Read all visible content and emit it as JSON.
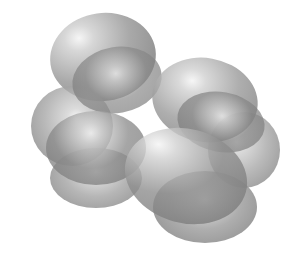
{
  "figure": {
    "background": "#ffffff",
    "base_color": "#8c8c8c",
    "highlight_color": "#f4f4f4",
    "lobes": [
      {
        "name": "lobe-top-left-back",
        "cx": 103,
        "cy": 57,
        "rx": 53,
        "ry": 44,
        "rot": -8,
        "hx": 30,
        "hy": 25,
        "alpha": 0.85,
        "shade": "#9a9a9a"
      },
      {
        "name": "lobe-left-back",
        "cx": 72,
        "cy": 126,
        "rx": 41,
        "ry": 40,
        "rot": 0,
        "hx": 55,
        "hy": 40,
        "alpha": 0.75,
        "shade": "#a3a3a3"
      },
      {
        "name": "lobe-right-back",
        "cx": 244,
        "cy": 150,
        "rx": 36,
        "ry": 38,
        "rot": 0,
        "hx": 40,
        "hy": 40,
        "alpha": 0.75,
        "shade": "#a3a3a3"
      },
      {
        "name": "lobe-bottom-left-back",
        "cx": 96,
        "cy": 178,
        "rx": 46,
        "ry": 30,
        "rot": 0,
        "hx": 50,
        "hy": 40,
        "alpha": 0.75,
        "shade": "#9e9e9e"
      },
      {
        "name": "lobe-bottom-right-back",
        "cx": 205,
        "cy": 207,
        "rx": 52,
        "ry": 36,
        "rot": 0,
        "hx": 50,
        "hy": 40,
        "alpha": 0.8,
        "shade": "#9a9a9a"
      },
      {
        "name": "lobe-top-left-front",
        "cx": 117,
        "cy": 80,
        "rx": 45,
        "ry": 33,
        "rot": -10,
        "hx": 50,
        "hy": 40,
        "alpha": 0.7,
        "shade": "#8a8a8a"
      },
      {
        "name": "lobe-right-upper",
        "cx": 205,
        "cy": 100,
        "rx": 53,
        "ry": 42,
        "rot": 10,
        "hx": 35,
        "hy": 30,
        "alpha": 0.8,
        "shade": "#9a9a9a"
      },
      {
        "name": "lobe-right-upper-front",
        "cx": 221,
        "cy": 122,
        "rx": 44,
        "ry": 30,
        "rot": 10,
        "hx": 50,
        "hy": 40,
        "alpha": 0.7,
        "shade": "#858585"
      },
      {
        "name": "lobe-left-mid-front",
        "cx": 96,
        "cy": 148,
        "rx": 50,
        "ry": 37,
        "rot": 0,
        "hx": 45,
        "hy": 30,
        "alpha": 0.75,
        "shade": "#888888"
      },
      {
        "name": "lobe-center-bottom",
        "cx": 186,
        "cy": 176,
        "rx": 62,
        "ry": 47,
        "rot": 15,
        "hx": 22,
        "hy": 25,
        "alpha": 0.8,
        "shade": "#8e8e8e"
      }
    ]
  }
}
